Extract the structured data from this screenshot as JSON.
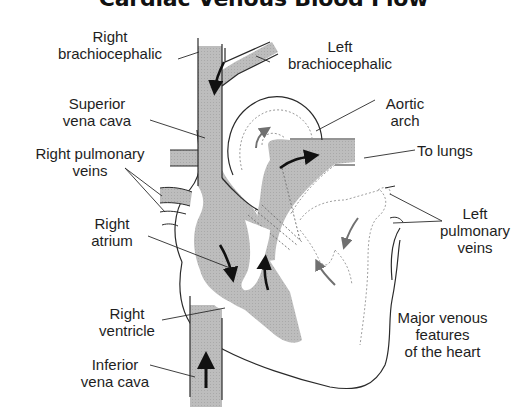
{
  "title": "Cardiac Venous Blood Flow",
  "colors": {
    "vessel_fill": "#b9b9b9",
    "outline": "#2a2a2a",
    "dotted": "#9a9a9a",
    "arrow_dark": "#111111",
    "arrow_gray": "#6f6f6f",
    "background": "#ffffff"
  },
  "labels": {
    "right_brachiocephalic": "Right\nbrachiocephalic",
    "left_brachiocephalic": "Left\nbrachiocephalic",
    "superior_vena_cava": "Superior\nvena cava",
    "aortic_arch": "Aortic\narch",
    "right_pulmonary_veins": "Right pulmonary\nveins",
    "to_lungs": "To lungs",
    "left_pulmonary_veins": "Left\npulmonary\nveins",
    "right_atrium": "Right\natrium",
    "right_ventricle": "Right\nventricle",
    "inferior_vena_cava": "Inferior\nvena cava",
    "caption": "Major venous\nfeatures\nof the heart"
  }
}
